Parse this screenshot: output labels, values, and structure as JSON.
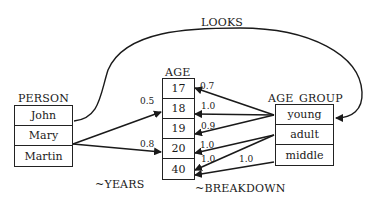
{
  "diagram": {
    "entities": {
      "person": {
        "title": "PERSON",
        "items": [
          "John",
          "Mary",
          "Martin"
        ]
      },
      "age": {
        "title": "AGE",
        "items": [
          "17",
          "18",
          "19",
          "20",
          "40"
        ]
      },
      "age_group": {
        "title": "AGE_GROUP",
        "items": [
          "young",
          "adult",
          "middle"
        ]
      }
    },
    "relations": {
      "looks": "LOOKS",
      "years": "~YEARS",
      "breakdown": "~BREAKDOWN"
    },
    "edges": [
      {
        "from": "John",
        "to": "young",
        "relation": "LOOKS",
        "weight": ""
      },
      {
        "from": "Mary",
        "to": "18",
        "relation": "~YEARS",
        "weight": "0.5"
      },
      {
        "from": "Mary",
        "to": "20",
        "relation": "~YEARS",
        "weight": "0.8"
      },
      {
        "from": "young",
        "to": "17",
        "relation": "~BREAKDOWN",
        "weight": "0.7"
      },
      {
        "from": "young",
        "to": "18",
        "relation": "~BREAKDOWN",
        "weight": "1.0"
      },
      {
        "from": "young",
        "to": "19",
        "relation": "~BREAKDOWN",
        "weight": "0.9"
      },
      {
        "from": "adult",
        "to": "20",
        "relation": "~BREAKDOWN",
        "weight": "1.0"
      },
      {
        "from": "adult",
        "to": "40",
        "relation": "~BREAKDOWN",
        "weight": "1.0"
      },
      {
        "from": "middle",
        "to": "40",
        "relation": "~BREAKDOWN",
        "weight": "1.0"
      }
    ],
    "weights": {
      "mary_18": "0.5",
      "mary_20": "0.8",
      "young_17": "0.7",
      "young_18": "1.0",
      "young_19": "0.9",
      "adult_20": "1.0",
      "adult_40": "1.0",
      "middle_40": "1.0"
    }
  }
}
